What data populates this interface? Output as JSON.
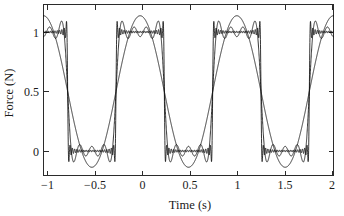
{
  "chart_data": {
    "type": "line",
    "title": "",
    "xlabel": "Time (s)",
    "ylabel": "Force (N)",
    "xlim": [
      -1,
      2
    ],
    "ylim": [
      -0.21,
      1.21
    ],
    "grid": false,
    "legend": "none",
    "xticks": [
      -1,
      -0.5,
      0,
      0.5,
      1,
      1.5,
      2
    ],
    "xticklabels": [
      "−1",
      "−0.5",
      "0",
      "0.5",
      "1",
      "1.5",
      "2"
    ],
    "yticks": [
      0,
      0.5,
      1
    ],
    "yticklabels": [
      "0",
      "0.5",
      "1"
    ],
    "series": [
      {
        "name": "fundamental",
        "harmonics": 1,
        "style": "smooth sinusoid",
        "peak": 1.137,
        "trough": -0.137
      },
      {
        "name": "partial-sum-mid",
        "harmonics": 7,
        "style": "ripple with sloped edges",
        "peak": 1.09,
        "trough": -0.09
      },
      {
        "name": "partial-sum-high",
        "harmonics": 41,
        "style": "near-vertical edges with fine Gibbs ripple",
        "peak": 1.09,
        "trough": -0.09
      }
    ],
    "square_wave": {
      "period": 1.0,
      "low_level": 0,
      "high_level": 1,
      "duty_cycle": 0.5,
      "high_intervals": [
        [
          -1.0,
          -0.75
        ],
        [
          -0.25,
          0.25
        ],
        [
          0.75,
          1.25
        ],
        [
          1.75,
          2.0
        ]
      ],
      "low_intervals": [
        [
          -0.75,
          -0.25
        ],
        [
          0.25,
          0.75
        ],
        [
          1.25,
          1.75
        ]
      ]
    }
  }
}
